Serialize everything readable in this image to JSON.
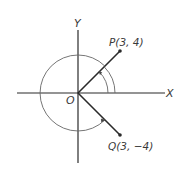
{
  "diagram": {
    "axes": {
      "x_label": "X",
      "y_label": "Y",
      "origin_label": "O"
    },
    "points": [
      {
        "id": "P",
        "label": "P(3, 4)",
        "x": 3,
        "y": 4
      },
      {
        "id": "Q",
        "label": "Q(3, −4)",
        "x": 3,
        "y": -4
      }
    ],
    "angles": [
      {
        "name": "angle-XOP",
        "description": "positive angle from OX to OP (double arc)"
      },
      {
        "name": "angle-XOQ-reflex",
        "description": "reflex angle from OX counterclockwise to OQ"
      }
    ],
    "colors": {
      "line": "#2a2a2a",
      "arc": "#666666",
      "text": "#3a3a3a"
    }
  }
}
